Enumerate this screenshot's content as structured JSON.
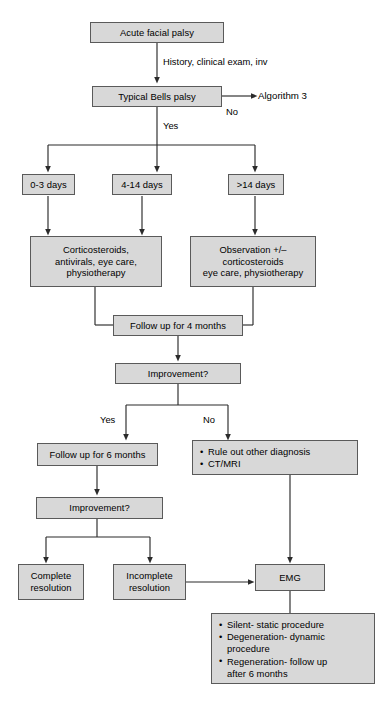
{
  "diagram": {
    "style": {
      "node_fill": "#d8d8d8",
      "node_border": "#5a5a5a",
      "line_color": "#2b2b2b",
      "background": "#ffffff"
    },
    "nodes": {
      "acute_facial_palsy": {
        "label": "Acute facial palsy"
      },
      "typical_bells_palsy": {
        "label": "Typical Bells palsy"
      },
      "algorithm_3": {
        "label": "Algorithm 3"
      },
      "days_0_3": {
        "label": "0-3 days"
      },
      "days_4_14": {
        "label": "4-14 days"
      },
      "days_gt_14": {
        "label": ">14 days"
      },
      "treatment_early": {
        "line1": "Corticosteroids,",
        "line2": "antivirals, eye care,",
        "line3": "physiotherapy"
      },
      "treatment_late": {
        "line1": "Observation +/–",
        "line2": "corticosteroids",
        "line3": "eye care, physiotherapy"
      },
      "follow_up_4_months": {
        "label": "Follow up for 4 months"
      },
      "improvement_1": {
        "label": "Improvement?"
      },
      "follow_up_6_months": {
        "label": "Follow up for 6 months"
      },
      "workup": {
        "bullet1": "Rule out other diagnosis",
        "bullet2": "CT/MRI"
      },
      "improvement_2": {
        "label": "Improvement?"
      },
      "complete_resolution": {
        "line1": "Complete",
        "line2": "resolution"
      },
      "incomplete_resolution": {
        "line1": "Incomplete",
        "line2": "resolution"
      },
      "emg": {
        "label": "EMG"
      },
      "emg_outcomes": {
        "bullet1": "Silent- static procedure",
        "bullet2": "Degeneration- dynamic",
        "bullet2_cont": "procedure",
        "bullet3": "Regeneration- follow up",
        "bullet3_cont": "after 6 months"
      }
    },
    "edge_labels": {
      "history_exam": "History, clinical exam, inv",
      "bells_no": "No",
      "bells_yes": "Yes",
      "improvement1_yes": "Yes",
      "improvement1_no": "No"
    }
  }
}
